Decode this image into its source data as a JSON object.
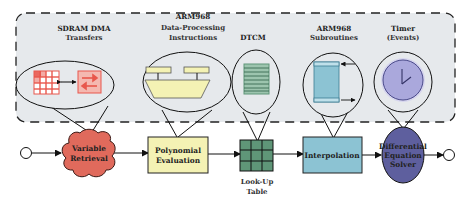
{
  "colors": {
    "region_fill": "#e6e9ec",
    "region_stroke": "#2a2a2a",
    "sdram_red": "#e8574c",
    "sdram_red_fill": "#f4b8b0",
    "poly_yellow": "#f4f2b4",
    "dtcm_green": "#5f9678",
    "dtcm_green_light": "#9cc4ae",
    "sub_blue": "#8cc3d3",
    "sub_blue_light": "#bfe0ea",
    "timer_purple": "#aaa8dc",
    "solver_purple": "#5e5f9e",
    "cloud_red": "#e06a5c"
  },
  "region": {
    "label": "hardware resources"
  },
  "resources": [
    {
      "id": "sdram",
      "title_line1": "SDRAM DMA",
      "title_line2": "Transfers"
    },
    {
      "id": "arm-dp",
      "title_line0": "ARM968",
      "title_line1": "Data-Processing",
      "title_line2": "Instructions"
    },
    {
      "id": "dtcm",
      "title_line1": "DTCM"
    },
    {
      "id": "arm-sub",
      "title_line1": "ARM968",
      "title_line2": "Subroutines"
    },
    {
      "id": "timer",
      "title_line1": "Timer",
      "title_line2": "(Events)"
    }
  ],
  "pipeline": [
    {
      "id": "start",
      "type": "terminal"
    },
    {
      "id": "variable-retrieval",
      "type": "cloud",
      "line1": "Variable",
      "line2": "Retrieval"
    },
    {
      "id": "polynomial-evaluation",
      "type": "box",
      "line1": "Polynomial",
      "line2": "Evaluation"
    },
    {
      "id": "lookup-table",
      "type": "grid",
      "caption_line1": "Look-Up",
      "caption_line2": "Table"
    },
    {
      "id": "interpolation",
      "type": "box",
      "line1": "Interpolation"
    },
    {
      "id": "differential-equation-solver",
      "type": "ellipse",
      "line1": "Differential",
      "line2": "Equation",
      "line3": "Solver"
    },
    {
      "id": "end",
      "type": "terminal"
    }
  ]
}
